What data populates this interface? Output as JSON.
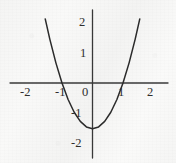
{
  "chart_data": {
    "type": "line",
    "title": "",
    "subtitle": "",
    "xlabel": "",
    "ylabel": "",
    "xlim": [
      -2.7,
      2.6
    ],
    "ylim": [
      -2.4,
      2.35
    ],
    "grid": false,
    "legend": null,
    "axis_color": "#3a3a3a",
    "curve_color": "#2b2b2b",
    "x_ticks": [
      -2,
      -1,
      1,
      2
    ],
    "x_tick_labels": [
      "-2",
      "-1",
      "1",
      "2"
    ],
    "y_ticks": [
      -2,
      -1,
      1,
      2
    ],
    "y_tick_labels": [
      "-2",
      "-1",
      "1",
      "2"
    ],
    "origin_label": "0",
    "series": [
      {
        "name": "parabola",
        "equation": "y = 1.5x^2 - 1.5",
        "vertex": [
          0,
          -1.5
        ],
        "roots": [
          -1,
          1
        ],
        "x": [
          -1.55,
          -1.4,
          -1.2,
          -1.0,
          -0.8,
          -0.6,
          -0.4,
          -0.2,
          0.0,
          0.2,
          0.4,
          0.6,
          0.8,
          1.0,
          1.2,
          1.4,
          1.55
        ],
        "y": [
          2.1,
          1.44,
          0.66,
          0.0,
          -0.54,
          -0.96,
          -1.26,
          -1.44,
          -1.5,
          -1.44,
          -1.26,
          -0.96,
          -0.54,
          0.0,
          0.66,
          1.44,
          2.1
        ]
      }
    ]
  },
  "axes_pixels": {
    "origin_x": 92.5,
    "origin_y": 83,
    "unit_px": 30.5,
    "x_axis_left": 10,
    "x_axis_right": 168,
    "y_axis_top": 10,
    "y_axis_bottom": 158
  },
  "labels": {
    "x_neg2": "-2",
    "x_neg1": "-1",
    "x_pos1": "1",
    "x_pos2": "2",
    "y_pos2": "2",
    "y_pos1": "1",
    "y_neg1": "-1",
    "y_neg2": "-2",
    "origin": "0"
  }
}
